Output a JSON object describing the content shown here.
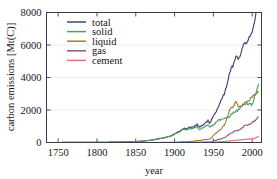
{
  "chart_data": {
    "type": "line",
    "title": "",
    "xlabel": "year",
    "ylabel": "carbon emissions [Mt(C)]",
    "xlim": [
      1735,
      2012
    ],
    "ylim": [
      0,
      8000
    ],
    "xticks": [
      1750,
      1800,
      1850,
      1900,
      1950,
      2000
    ],
    "yticks": [
      0,
      2000,
      4000,
      6000,
      8000
    ],
    "grid": true,
    "legend_position": "upper left",
    "x": [
      1751,
      1760,
      1770,
      1780,
      1790,
      1800,
      1810,
      1820,
      1830,
      1840,
      1850,
      1860,
      1870,
      1875,
      1880,
      1885,
      1890,
      1895,
      1900,
      1905,
      1910,
      1913,
      1915,
      1918,
      1920,
      1925,
      1929,
      1932,
      1935,
      1938,
      1940,
      1943,
      1945,
      1946,
      1950,
      1955,
      1960,
      1965,
      1970,
      1973,
      1975,
      1979,
      1980,
      1982,
      1985,
      1990,
      1992,
      1995,
      2000,
      2003,
      2005,
      2007,
      2008
    ],
    "series": [
      {
        "name": "total",
        "color": "#4b3f72",
        "values": [
          3,
          4,
          5,
          7,
          9,
          11,
          15,
          21,
          31,
          49,
          54,
          91,
          147,
          188,
          236,
          280,
          344,
          398,
          534,
          663,
          819,
          904,
          847,
          903,
          932,
          975,
          1145,
          940,
          1026,
          1118,
          1225,
          1344,
          1160,
          1239,
          1630,
          2043,
          2577,
          3096,
          4054,
          4619,
          4614,
          5353,
          5315,
          5133,
          5441,
          6143,
          6109,
          6398,
          6735,
          7396,
          8090,
          8364,
          8749
        ]
      },
      {
        "name": "solid",
        "color": "#4a9e68",
        "values": [
          3,
          4,
          5,
          7,
          9,
          11,
          15,
          21,
          31,
          48,
          53,
          89,
          143,
          182,
          228,
          270,
          331,
          382,
          508,
          624,
          766,
          843,
          782,
          824,
          841,
          869,
          1003,
          795,
          858,
          923,
          1011,
          1110,
          934,
          989,
          1070,
          1313,
          1419,
          1546,
          1556,
          1720,
          1784,
          1924,
          1971,
          1990,
          2186,
          2395,
          2363,
          2407,
          2333,
          2796,
          3097,
          3300,
          3581
        ]
      },
      {
        "name": "liquid",
        "color": "#9a8339",
        "values": [
          0,
          0,
          0,
          0,
          0,
          0,
          0,
          0,
          0,
          0,
          0,
          1,
          1,
          2,
          3,
          4,
          7,
          9,
          17,
          26,
          41,
          47,
          50,
          56,
          65,
          84,
          126,
          124,
          142,
          168,
          183,
          204,
          202,
          216,
          423,
          639,
          849,
          1132,
          1838,
          2238,
          2131,
          2536,
          2419,
          2228,
          2186,
          2422,
          2466,
          2588,
          2803,
          2954,
          3035,
          3107,
          3100
        ]
      },
      {
        "name": "gas",
        "color": "#8a5a7e",
        "values": [
          0,
          0,
          0,
          0,
          0,
          0,
          0,
          0,
          0,
          0,
          0,
          0,
          0,
          0,
          0,
          0,
          0,
          0,
          2,
          3,
          5,
          6,
          6,
          7,
          8,
          11,
          16,
          14,
          16,
          18,
          21,
          24,
          24,
          26,
          97,
          159,
          227,
          319,
          497,
          595,
          620,
          741,
          736,
          732,
          807,
          1028,
          1054,
          1116,
          1228,
          1332,
          1421,
          1502,
          1566
        ]
      },
      {
        "name": "cement",
        "color": "#e2706e",
        "values": [
          0,
          0,
          0,
          0,
          0,
          0,
          0,
          0,
          0,
          0,
          0,
          0,
          0,
          0,
          0,
          0,
          0,
          0,
          1,
          2,
          3,
          4,
          3,
          3,
          4,
          6,
          8,
          5,
          7,
          9,
          10,
          9,
          6,
          8,
          18,
          30,
          43,
          60,
          95,
          110,
          112,
          137,
          140,
          147,
          161,
          196,
          205,
          216,
          226,
          251,
          292,
          348,
          375
        ]
      }
    ]
  },
  "legend": {
    "entries": [
      {
        "label": "total"
      },
      {
        "label": "solid"
      },
      {
        "label": "liquid"
      },
      {
        "label": "gas"
      },
      {
        "label": "cement"
      }
    ]
  }
}
